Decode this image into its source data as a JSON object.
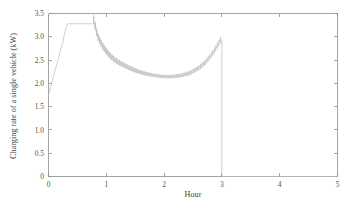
{
  "chart_data": {
    "type": "line",
    "title": "",
    "subtitle": "",
    "xlabel": "Hour",
    "ylabel": "Charging rate of a single vehicle (kW)",
    "xlim": [
      0,
      5
    ],
    "ylim": [
      0,
      3.5
    ],
    "xticks": [
      0,
      1,
      2,
      3,
      4,
      5
    ],
    "xtick_labels": [
      "0",
      "1",
      "2",
      "3",
      "4",
      "5"
    ],
    "yticks": [
      0,
      0.5,
      1.0,
      1.5,
      2.0,
      2.5,
      3.0,
      3.5
    ],
    "ytick_labels": [
      "0",
      "0.5",
      "1.0",
      "1.5",
      "2.0",
      "2.5",
      "3.0",
      "3.5"
    ],
    "grid": false,
    "legend": null,
    "legend_position": "none",
    "line_color": "#b9b9b9",
    "axis_color": "#8d8d8d",
    "annotations": [],
    "series": [
      {
        "name": "Charging rate of a single vehicle",
        "description": "Linear ramp from 1.75 kW to the 3.28 kW plateau, constant plateau, oscillating (sawtooth) decay to a minimum band near 2.1 kW, oscillating rise to 2.90 kW, then instantaneous drop to 0 at hour 3.",
        "x": [
          0.0,
          0.05,
          0.1,
          0.15,
          0.2,
          0.25,
          0.3,
          0.33,
          0.4,
          0.5,
          0.6,
          0.7,
          0.78,
          0.85,
          0.95,
          1.05,
          1.15,
          1.25,
          1.4,
          1.55,
          1.7,
          1.85,
          2.0,
          2.15,
          2.3,
          2.45,
          2.6,
          2.7,
          2.8,
          2.9,
          2.97,
          3.0,
          3.0,
          5.0
        ],
        "y": [
          1.75,
          1.98,
          2.21,
          2.44,
          2.67,
          2.9,
          3.18,
          3.28,
          3.28,
          3.28,
          3.28,
          3.28,
          3.28,
          2.93,
          2.7,
          2.55,
          2.44,
          2.37,
          2.28,
          2.21,
          2.16,
          2.13,
          2.11,
          2.11,
          2.13,
          2.18,
          2.28,
          2.38,
          2.52,
          2.7,
          2.85,
          2.9,
          0.0,
          0.0
        ]
      }
    ],
    "oscillation": {
      "present": true,
      "waveform": "sawtooth",
      "start_hour": 0.78,
      "end_hour": 3.0,
      "cycles": 84,
      "amplitude_start_kw": 0.18,
      "amplitude_mid_kw": 0.07,
      "amplitude_end_kw": 0.14
    },
    "key_points": {
      "initial_rate_kw": 1.75,
      "plateau_rate_kw": 3.28,
      "plateau_start_hour": 0.33,
      "plateau_end_hour": 0.78,
      "minimum_rate_kw": 2.11,
      "minimum_hour": 2.08,
      "final_peak_rate_kw": 2.9,
      "cutoff_hour": 3.0
    }
  }
}
